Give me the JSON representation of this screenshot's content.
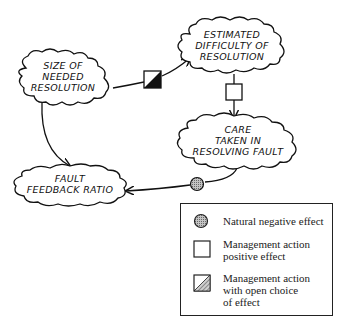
{
  "diagram": {
    "nodes": [
      {
        "id": "size",
        "lines": [
          "SIZE OF",
          "NEEDED",
          "RESOLUTION"
        ]
      },
      {
        "id": "estimated",
        "lines": [
          "ESTIMATED",
          "DIFFICULTY OF",
          "RESOLUTION"
        ]
      },
      {
        "id": "care",
        "lines": [
          "CARE",
          "TAKEN IN",
          "RESOLVING FAULT"
        ]
      },
      {
        "id": "fault",
        "lines": [
          "FAULT",
          "FEEDBACK RATIO"
        ]
      }
    ],
    "edges": [
      {
        "from": "size",
        "to": "estimated",
        "marker": "open-choice"
      },
      {
        "from": "estimated",
        "to": "care",
        "marker": "positive"
      },
      {
        "from": "care",
        "to": "fault",
        "marker": "natural-negative"
      },
      {
        "from": "size",
        "to": "fault",
        "marker": "none"
      }
    ]
  },
  "legend": {
    "items": [
      {
        "marker": "natural-negative",
        "label": "Natural negative effect"
      },
      {
        "marker": "positive",
        "label": "Management action\npositive effect"
      },
      {
        "marker": "open-choice",
        "label": "Management action\nwith open choice\nof effect"
      }
    ]
  },
  "colors": {
    "line": "#111111",
    "circle_fill": "#a8a8a8",
    "open_choice_fill": "#111111"
  }
}
